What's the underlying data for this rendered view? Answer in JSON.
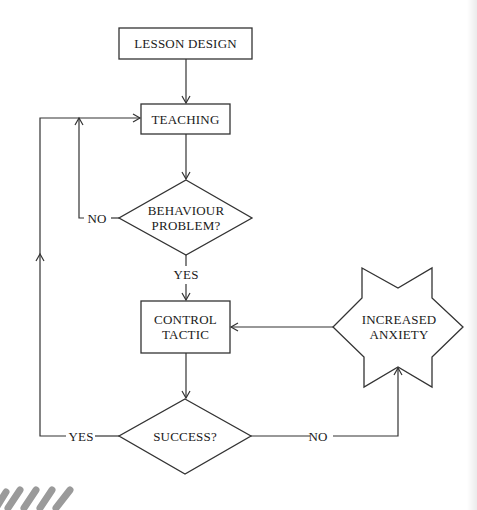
{
  "diagram": {
    "type": "flowchart",
    "nodes": {
      "lesson_design": {
        "shape": "rectangle",
        "label": "LESSON DESIGN"
      },
      "teaching": {
        "shape": "rectangle",
        "label": "TEACHING"
      },
      "behaviour_problem": {
        "shape": "diamond",
        "label_line1": "BEHAVIOUR",
        "label_line2": "PROBLEM?"
      },
      "control_tactic": {
        "shape": "rectangle",
        "label_line1": "CONTROL",
        "label_line2": "TACTIC"
      },
      "success": {
        "shape": "diamond",
        "label": "SUCCESS?"
      },
      "increased_anxiety": {
        "shape": "star",
        "label_line1": "INCREASED",
        "label_line2": "ANXIETY"
      }
    },
    "edges": [
      {
        "from": "lesson_design",
        "to": "teaching",
        "label": ""
      },
      {
        "from": "teaching",
        "to": "behaviour_problem",
        "label": ""
      },
      {
        "from": "behaviour_problem",
        "to": "teaching",
        "label": "NO"
      },
      {
        "from": "behaviour_problem",
        "to": "control_tactic",
        "label": "YES"
      },
      {
        "from": "control_tactic",
        "to": "success",
        "label": ""
      },
      {
        "from": "success",
        "to": "teaching",
        "label": "YES"
      },
      {
        "from": "success",
        "to": "increased_anxiety",
        "label": "NO"
      },
      {
        "from": "increased_anxiety",
        "to": "control_tactic",
        "label": ""
      }
    ],
    "edge_labels": {
      "behaviour_no": "NO",
      "behaviour_yes": "YES",
      "success_yes": "YES",
      "success_no": "NO"
    },
    "colors": {
      "stroke": "#333333",
      "text": "#1a1a1a",
      "background": "#ffffff",
      "decoration": "#9a9a9a"
    }
  }
}
